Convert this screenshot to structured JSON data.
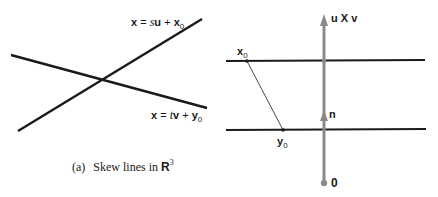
{
  "figure_a": {
    "caption": {
      "prefix": "(a)",
      "text": "Skew lines in ",
      "space": "R",
      "exponent": "3"
    },
    "line1": {
      "label_lhs": "x",
      "label_eq": " = ",
      "label_param": "s",
      "label_dir": "u",
      "label_plus": " + ",
      "label_point": "x",
      "label_point_sub": "0"
    },
    "line2": {
      "label_lhs": "x",
      "label_eq": " = ",
      "label_param": "t",
      "label_dir": "v",
      "label_plus": " + ",
      "label_point": "y",
      "label_point_sub": "0"
    }
  },
  "figure_b": {
    "normal_vector_label": "u X v",
    "unit_normal_label": "n",
    "origin_label": "0",
    "point_x0": {
      "base": "x",
      "sub": "0"
    },
    "point_y0": {
      "base": "y",
      "sub": "0"
    }
  },
  "colors": {
    "line": "#1a1a1a",
    "vector": "#8a8a8a",
    "background": "#ffffff"
  }
}
